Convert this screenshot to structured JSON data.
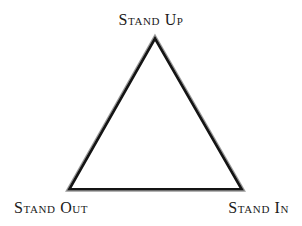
{
  "diagram": {
    "background_color": "#ffffff",
    "shape": {
      "name": "triangle",
      "style": "double-line outline",
      "fill": "none",
      "outer_stroke_color": "#9a9a9a",
      "inner_stroke_color": "#141414",
      "outer_stroke_width": 1,
      "inner_stroke_width": 3,
      "vertices": {
        "apex": {
          "x": 155,
          "y": 37
        },
        "bottom_left": {
          "x": 68,
          "y": 190
        },
        "bottom_right": {
          "x": 243,
          "y": 190
        }
      }
    },
    "labels": {
      "apex": "Stand Up",
      "bottom_left": "Stand Out",
      "bottom_right": "Stand In"
    },
    "label_color": "#1a1a1a"
  }
}
